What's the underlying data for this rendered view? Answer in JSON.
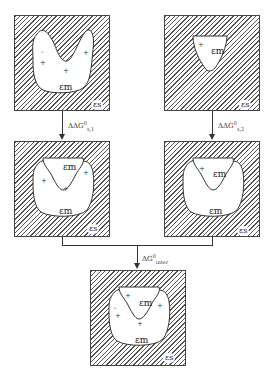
{
  "panels": {
    "top_left": {
      "eps_m": "εm",
      "eps_s": "εs",
      "signs": [
        "-",
        "+",
        "+",
        "+",
        "-"
      ]
    },
    "top_right": {
      "eps_m": "εm",
      "eps_s": "εs",
      "signs": [
        "+",
        "-"
      ]
    },
    "mid_left": {
      "eps_m_top": "εm",
      "eps_m_bottom": "εm",
      "eps_s": "εs",
      "signs": [
        "-",
        "+",
        "+",
        "+",
        "-"
      ]
    },
    "mid_right": {
      "eps_m_top": "εm",
      "eps_m_bottom": "εm",
      "eps_s": "εs",
      "signs": [
        "+",
        "-"
      ]
    },
    "bottom": {
      "eps_m_top": "εm",
      "eps_m_bottom": "εm",
      "eps_s": "εs",
      "signs": [
        "+",
        "-",
        "+",
        "+",
        "-",
        "+",
        "+",
        "-"
      ]
    }
  },
  "arrows": {
    "left": {
      "label": "ΔΔG",
      "sup": "0",
      "sub": "s,1"
    },
    "right": {
      "label": "ΔΔG",
      "sup": "0",
      "sub": "s,2"
    },
    "merge": {
      "label": "ΔG",
      "sup": "0",
      "sub": "inter"
    }
  }
}
